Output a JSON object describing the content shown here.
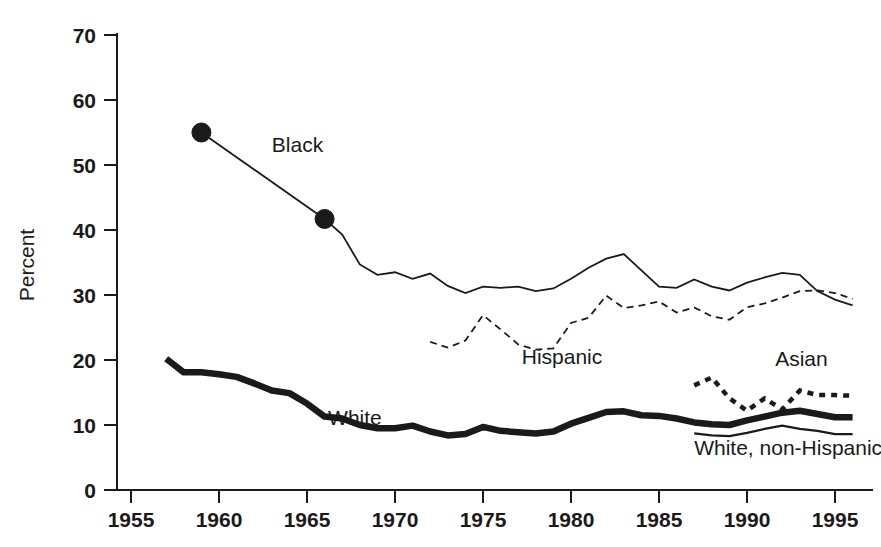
{
  "chart_data": {
    "type": "line",
    "title": "",
    "xlabel": "",
    "ylabel": "Percent",
    "xlim": [
      1955,
      1996
    ],
    "ylim": [
      0,
      70
    ],
    "xticks": [
      1955,
      1960,
      1965,
      1970,
      1975,
      1980,
      1985,
      1990,
      1995
    ],
    "yticks": [
      0,
      10,
      20,
      30,
      40,
      50,
      60,
      70
    ],
    "grid": false,
    "legend_position": "inline-annotations",
    "series": [
      {
        "name": "Black",
        "style": "thin-solid-with-markers",
        "label": "Black",
        "label_x": 1963.0,
        "label_y": 52.0,
        "markers_at": [
          1959,
          1966
        ],
        "x": [
          1959,
          1966,
          1967,
          1968,
          1969,
          1970,
          1971,
          1972,
          1973,
          1974,
          1975,
          1976,
          1977,
          1978,
          1979,
          1980,
          1981,
          1982,
          1983,
          1984,
          1985,
          1986,
          1987,
          1988,
          1989,
          1990,
          1991,
          1992,
          1993,
          1994,
          1995,
          1996
        ],
        "values": [
          55.0,
          41.7,
          39.3,
          34.7,
          33.1,
          33.5,
          32.5,
          33.3,
          31.4,
          30.3,
          31.3,
          31.1,
          31.3,
          30.6,
          31.0,
          32.5,
          34.2,
          35.6,
          36.3,
          33.8,
          31.3,
          31.1,
          32.4,
          31.3,
          30.7,
          31.9,
          32.7,
          33.4,
          33.1,
          30.6,
          29.3,
          28.4
        ]
      },
      {
        "name": "Hispanic",
        "style": "thin-dashed",
        "label": "Hispanic",
        "label_x": 1977.2,
        "label_y": 19.4,
        "x": [
          1972,
          1973,
          1974,
          1975,
          1976,
          1977,
          1978,
          1979,
          1980,
          1981,
          1982,
          1983,
          1984,
          1985,
          1986,
          1987,
          1988,
          1989,
          1990,
          1991,
          1992,
          1993,
          1994,
          1995,
          1996
        ],
        "values": [
          22.8,
          21.9,
          23.0,
          26.9,
          24.7,
          22.4,
          21.6,
          21.8,
          25.7,
          26.5,
          29.9,
          28.0,
          28.4,
          29.0,
          27.3,
          28.1,
          26.7,
          26.2,
          28.1,
          28.7,
          29.6,
          30.6,
          30.7,
          30.3,
          29.4
        ]
      },
      {
        "name": "White",
        "style": "thick-solid",
        "label": "White",
        "label_x": 1966.2,
        "label_y": 10.0,
        "x": [
          1957,
          1958,
          1959,
          1960,
          1961,
          1962,
          1963,
          1964,
          1965,
          1966,
          1967,
          1968,
          1969,
          1970,
          1971,
          1972,
          1973,
          1974,
          1975,
          1976,
          1977,
          1978,
          1979,
          1980,
          1981,
          1982,
          1983,
          1984,
          1985,
          1986,
          1987,
          1988,
          1989,
          1990,
          1991,
          1992,
          1993,
          1994,
          1995,
          1996
        ],
        "values": [
          20.2,
          18.1,
          18.1,
          17.8,
          17.4,
          16.4,
          15.3,
          14.9,
          13.3,
          11.3,
          11.0,
          10.0,
          9.5,
          9.5,
          9.9,
          9.0,
          8.4,
          8.6,
          9.7,
          9.1,
          8.9,
          8.7,
          9.0,
          10.2,
          11.1,
          12.0,
          12.1,
          11.5,
          11.4,
          11.0,
          10.4,
          10.1,
          10.0,
          10.7,
          11.3,
          11.9,
          12.2,
          11.7,
          11.2,
          11.2
        ]
      },
      {
        "name": "Asian",
        "style": "thick-dotted",
        "label": "Asian",
        "label_x": 1991.6,
        "label_y": 19.1,
        "x": [
          1987,
          1988,
          1989,
          1990,
          1991,
          1992,
          1993,
          1994,
          1995,
          1996
        ],
        "values": [
          16.1,
          17.3,
          14.1,
          12.2,
          14.1,
          12.4,
          15.3,
          14.6,
          14.6,
          14.5
        ]
      },
      {
        "name": "White, non-Hispanic",
        "style": "thin-solid",
        "label": "White, non-Hispanic",
        "label_x": 1987.0,
        "label_y": 5.4,
        "x": [
          1987,
          1988,
          1989,
          1990,
          1991,
          1992,
          1993,
          1994,
          1995,
          1996
        ],
        "values": [
          8.7,
          8.4,
          8.3,
          8.8,
          9.4,
          9.9,
          9.4,
          9.1,
          8.6,
          8.6
        ]
      }
    ]
  },
  "axis": {
    "y_title": "Percent",
    "y_tick_labels": [
      "0",
      "10",
      "20",
      "30",
      "40",
      "50",
      "60",
      "70"
    ],
    "x_tick_labels": [
      "1955",
      "1960",
      "1965",
      "1970",
      "1975",
      "1980",
      "1985",
      "1990",
      "1995"
    ]
  },
  "labels": {
    "black": "Black",
    "hispanic": "Hispanic",
    "white": "White",
    "asian": "Asian",
    "white_non_hispanic": "White, non-Hispanic"
  },
  "colors": {
    "ink": "#1a1a1a",
    "background": "#ffffff"
  }
}
